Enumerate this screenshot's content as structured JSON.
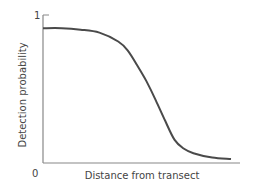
{
  "chart_data": {
    "type": "line",
    "title": "",
    "xlabel": "Distance from transect",
    "ylabel": "Detection probability",
    "ylim": [
      0,
      1
    ],
    "y_ticks": [
      "1"
    ],
    "origin_label": "0",
    "grid": false,
    "legend": null,
    "series": [
      {
        "name": "Detection function",
        "x": [
          0,
          0.1,
          0.2,
          0.3,
          0.4,
          0.45,
          0.5,
          0.55,
          0.6,
          0.65,
          0.7,
          0.75,
          0.8,
          0.9,
          1.0
        ],
        "values": [
          0.91,
          0.91,
          0.9,
          0.88,
          0.82,
          0.76,
          0.66,
          0.55,
          0.42,
          0.28,
          0.15,
          0.09,
          0.06,
          0.03,
          0.02
        ]
      }
    ]
  },
  "labels": {
    "ylabel": "Detection probability",
    "xlabel": "Distance from transect",
    "y_top_tick": "1",
    "origin": "0"
  },
  "colors": {
    "curve": "#4a4a4a",
    "axis": "#888888",
    "text": "#444444"
  }
}
